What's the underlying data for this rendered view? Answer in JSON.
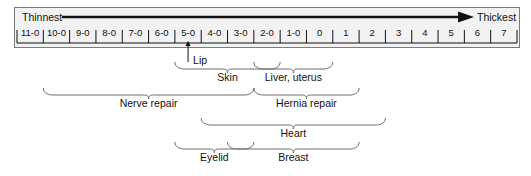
{
  "figure": {
    "background_color": "#ffffff",
    "scale_box_fill": "#f2f2f2",
    "scale_box_border": "#7a7a7a",
    "ink_color": "#111111",
    "brace_color": "#6d6d6d"
  },
  "direction": {
    "left_label": "Thinnest",
    "right_label": "Thickest",
    "arrow": "right-arrow"
  },
  "scale": {
    "ticks": [
      "11-0",
      "10-0",
      "9-0",
      "8-0",
      "7-0",
      "6-0",
      "5-0",
      "4-0",
      "3-0",
      "2-0",
      "1-0",
      "0",
      "1",
      "2",
      "3",
      "4",
      "5",
      "6",
      "7"
    ]
  },
  "pointers": [
    {
      "label": "Lip",
      "target_tick": "5-0"
    }
  ],
  "groups": [
    {
      "label": "Skin",
      "from_tick": "5-0",
      "to_tick": "2-0"
    },
    {
      "label": "Liver, uterus",
      "from_tick": "2-0",
      "to_tick": "0"
    },
    {
      "label": "Nerve repair",
      "from_tick": "10-0",
      "to_tick": "3-0"
    },
    {
      "label": "Hernia repair",
      "from_tick": "2-0",
      "to_tick": "1"
    },
    {
      "label": "Heart",
      "from_tick": "4-0",
      "to_tick": "2"
    },
    {
      "label": "Eyelid",
      "from_tick": "5-0",
      "to_tick": "3-0"
    },
    {
      "label": "Breast",
      "from_tick": "3-0",
      "to_tick": "1"
    }
  ]
}
